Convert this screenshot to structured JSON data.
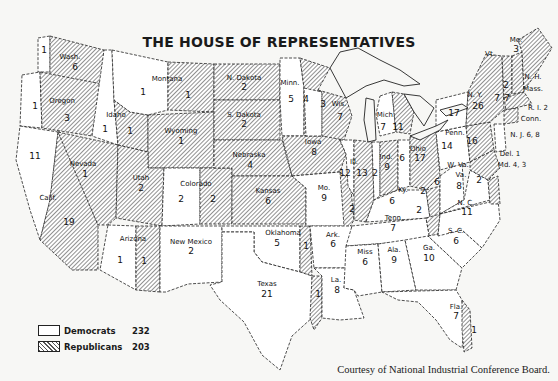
{
  "title": "THE HOUSE OF REPRESENTATIVES",
  "legend": {
    "democrats": {
      "label": "Democrats",
      "count": "232"
    },
    "republicans": {
      "label": "Republicans",
      "count": "203"
    }
  },
  "credit": "Courtesy of National Industrial Conference Board.",
  "colors": {
    "democrat_fill": "#ffffff",
    "republican_hatch": "#555555",
    "background": "#f7f7f5"
  },
  "states": [
    {
      "name": "Wash.",
      "dem": 1,
      "rep": 6
    },
    {
      "name": "Oregon",
      "dem": 1,
      "rep": 3
    },
    {
      "name": "Calif.",
      "dem": 11,
      "rep": 19
    },
    {
      "name": "Idaho",
      "dem": 1,
      "rep": 1
    },
    {
      "name": "Nevada",
      "dem": 0,
      "rep": 1
    },
    {
      "name": "Montana",
      "dem": 1,
      "rep": 1
    },
    {
      "name": "Wyoming",
      "dem": 0,
      "rep": 1
    },
    {
      "name": "Utah",
      "dem": 0,
      "rep": 2
    },
    {
      "name": "Colorado",
      "dem": 2,
      "rep": 2
    },
    {
      "name": "Arizona",
      "dem": 1,
      "rep": 1
    },
    {
      "name": "New Mexico",
      "dem": 2,
      "rep": 0
    },
    {
      "name": "N. Dakota",
      "dem": 0,
      "rep": 2
    },
    {
      "name": "S. Dakota",
      "dem": 0,
      "rep": 2
    },
    {
      "name": "Nebraska",
      "dem": 0,
      "rep": 4
    },
    {
      "name": "Kansas",
      "dem": 0,
      "rep": 6
    },
    {
      "name": "Oklahoma",
      "dem": 5,
      "rep": 1
    },
    {
      "name": "Texas",
      "dem": 21,
      "rep": 1
    },
    {
      "name": "Minn.",
      "dem": 5,
      "rep": 4
    },
    {
      "name": "Iowa",
      "dem": 0,
      "rep": 8
    },
    {
      "name": "Mo.",
      "dem": 9,
      "rep": 2
    },
    {
      "name": "Ark.",
      "dem": 6,
      "rep": 0
    },
    {
      "name": "La.",
      "dem": 8,
      "rep": 0
    },
    {
      "name": "Wis.",
      "dem": 3,
      "rep": 7
    },
    {
      "name": "Ill.",
      "dem": 12,
      "rep": 13
    },
    {
      "name": "Mich.",
      "dem": 7,
      "rep": 11
    },
    {
      "name": "Ind.",
      "dem": 2,
      "rep": 9
    },
    {
      "name": "Ohio",
      "dem": 6,
      "rep": 17
    },
    {
      "name": "Ky.",
      "dem": 6,
      "rep": 2
    },
    {
      "name": "Tenn.",
      "dem": 7,
      "rep": 2
    },
    {
      "name": "Miss",
      "dem": 6,
      "rep": 0
    },
    {
      "name": "Ala.",
      "dem": 9,
      "rep": 0
    },
    {
      "name": "Ga.",
      "dem": 10,
      "rep": 0
    },
    {
      "name": "Fla.",
      "dem": 7,
      "rep": 1
    },
    {
      "name": "S. C.",
      "dem": 6,
      "rep": 0
    },
    {
      "name": "N. C.",
      "dem": 11,
      "rep": 0
    },
    {
      "name": "Va.",
      "dem": 8,
      "rep": 2
    },
    {
      "name": "W. Va.",
      "dem": 6,
      "rep": 0
    },
    {
      "name": "Penn.",
      "dem": 14,
      "rep": 16
    },
    {
      "name": "N. Y.",
      "dem": 17,
      "rep": 26
    },
    {
      "name": "N. J.",
      "dem": 6,
      "rep": 8
    },
    {
      "name": "Del.",
      "dem": 1,
      "rep": 0
    },
    {
      "name": "Md.",
      "dem": 4,
      "rep": 3
    },
    {
      "name": "Vt.",
      "dem": 0,
      "rep": 1
    },
    {
      "name": "N. H.",
      "dem": 0,
      "rep": 2
    },
    {
      "name": "Mass.",
      "dem": 7,
      "rep": 7
    },
    {
      "name": "R. I.",
      "dem": 2,
      "rep": 0
    },
    {
      "name": "Conn.",
      "dem": 0,
      "rep": 0
    },
    {
      "name": "Me.",
      "dem": 0,
      "rep": 3
    }
  ],
  "labels": {
    "wash": "Wash.",
    "wash_r": "6",
    "wash_d": "1",
    "oregon": "Oregon",
    "oregon_r": "3",
    "oregon_d": "1",
    "calif": "Calif.",
    "calif_r": "19",
    "calif_d": "11",
    "idaho": "Idaho",
    "idaho_d": "1",
    "idaho_r": "1",
    "nevada": "Nevada",
    "nevada_r": "1",
    "montana": "Montana",
    "montana_d": "1",
    "montana_r": "1",
    "wyoming": "Wyoming",
    "wyoming_r": "1",
    "utah": "Utah",
    "utah_r": "2",
    "colorado": "Colorado",
    "colorado_d": "2",
    "colorado_r": "2",
    "arizona": "Arizona",
    "arizona_d": "1",
    "arizona_r": "1",
    "newmexico": "New Mexico",
    "newmexico_d": "2",
    "ndakota": "N. Dakota",
    "ndakota_r": "2",
    "sdakota": "S. Dakota",
    "sdakota_r": "2",
    "nebraska": "Nebraska",
    "nebraska_r": "4",
    "kansas": "Kansas",
    "kansas_r": "6",
    "oklahoma": "Oklahoma",
    "oklahoma_d": "5",
    "oklahoma_r": "1",
    "texas": "Texas",
    "texas_d": "21",
    "texas_r": "1",
    "minn": "Minn.",
    "minn_d": "5",
    "minn_r": "4",
    "iowa": "Iowa",
    "iowa_r": "8",
    "mo": "Mo.",
    "mo_d": "9",
    "mo_r": "2",
    "ark": "Ark.",
    "ark_d": "6",
    "la": "La.",
    "la_d": "8",
    "wis": "Wis.",
    "wis_d": "3",
    "wis_r": "7",
    "ill": "Ill.",
    "ill_d": "12",
    "ill_r": "13",
    "mich": "Mich.",
    "mich_d": "7",
    "mich_r": "11",
    "ind": "Ind.",
    "ind_d": "2",
    "ind_r": "9",
    "ohio": "Ohio",
    "ohio_d": "6",
    "ohio_r": "17",
    "ky": "Ky.",
    "ky_d": "6",
    "ky_r": "2",
    "tenn": "Tenn.",
    "tenn_d": "7",
    "tenn_r": "2",
    "miss": "Miss",
    "miss_d": "6",
    "ala": "Ala.",
    "ala_d": "9",
    "ga": "Ga.",
    "ga_d": "10",
    "fla": "Fla.",
    "fla_d": "7",
    "fla_r": "1",
    "sc": "S. C.",
    "sc_d": "6",
    "nc": "N. C.",
    "nc_d": "11",
    "va": "Va.",
    "va_d": "8",
    "va_r": "2",
    "wva": "W. Va.",
    "wva_d": "6",
    "penn": "Penn.",
    "penn_d": "14",
    "penn_r": "16",
    "ny": "N. Y.",
    "ny_d": "17",
    "ny_r": "26",
    "nj": "N. J. 6, 8",
    "del": "Del. 1",
    "md": "Md. 4, 3",
    "vt": "Vt.",
    "nh": "N. H.",
    "nh_r": "2",
    "mass": "Mass.",
    "mass_d": "7",
    "mass_r": "7",
    "ri": "R. I. 2",
    "conn": "Conn.",
    "me": "Me.",
    "me_r": "3"
  }
}
